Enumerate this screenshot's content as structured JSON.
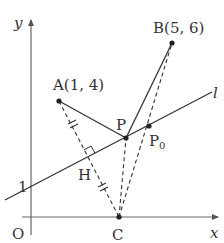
{
  "diagram": {
    "type": "coordinate-geometry",
    "axes": {
      "x_label": "x",
      "y_label": "y",
      "origin_label": "O",
      "y_tick_label": "1"
    },
    "line_label": "l",
    "points": {
      "A": {
        "label": "A(1, 4)"
      },
      "B": {
        "label": "B(5, 6)"
      },
      "P": {
        "label": "P"
      },
      "P0": {
        "label": "P",
        "subscript": "0"
      },
      "H": {
        "label": "H"
      },
      "C": {
        "label": "C"
      }
    },
    "colors": {
      "line": "#333333",
      "axis": "#666666",
      "background": "#ffffff"
    }
  }
}
